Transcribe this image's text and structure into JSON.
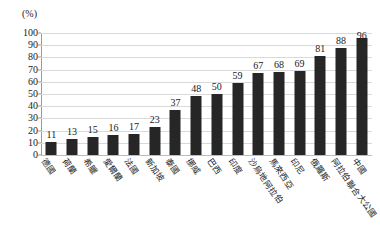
{
  "chart_data": {
    "type": "bar",
    "title": "",
    "subtitle": "",
    "xlabel": "",
    "ylabel": "",
    "unit_label": "(%)",
    "ylim": [
      0,
      100
    ],
    "ytick_step": 10,
    "yticks": [
      0,
      10,
      20,
      30,
      40,
      50,
      60,
      70,
      80,
      90,
      100
    ],
    "grid": true,
    "legend": false,
    "legend_position": "none",
    "bar_color": "#262626",
    "gridline_color": "#d9d9d9",
    "axis_color": "#9a9a9a",
    "categories": [
      "德國",
      "荷蘭",
      "希臘",
      "愛爾蘭",
      "法國",
      "新加坡",
      "泰國",
      "挪威",
      "巴西",
      "印度",
      "沙烏地阿拉伯",
      "馬來西亞",
      "印尼",
      "俄羅斯",
      "阿拉伯聯合大公國",
      "中國"
    ],
    "values": [
      11,
      13,
      15,
      16,
      17,
      23,
      37,
      48,
      50,
      59,
      67,
      68,
      69,
      81,
      88,
      96
    ],
    "data_labels": [
      "11",
      "13",
      "15",
      "16",
      "17",
      "23",
      "37",
      "48",
      "50",
      "59",
      "67",
      "68",
      "69",
      "81",
      "88",
      "96"
    ]
  }
}
